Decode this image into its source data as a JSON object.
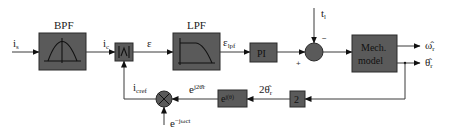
{
  "diagram": {
    "type": "block-diagram",
    "colors": {
      "block_fill": "#5a5a5a",
      "wire": "#3a3a3a",
      "background": "#ffffff"
    },
    "blocks": {
      "bpf": {
        "title": "BPF",
        "icon": "bandpass-curve-icon"
      },
      "abs": {
        "label": "|∧|",
        "icon": "absolute-value-icon"
      },
      "lpf": {
        "title": "LPF",
        "icon": "lowpass-curve-icon"
      },
      "pi": {
        "label": "PI"
      },
      "mech": {
        "line1": "Mech.",
        "line2": "model"
      },
      "exp": {
        "base": "e",
        "exponent": "j(θ)"
      },
      "gain": {
        "label": "2"
      }
    },
    "signals": {
      "input": {
        "main": "i",
        "sub": "s"
      },
      "ic": {
        "main": "i",
        "sub": "c"
      },
      "eps": {
        "main": "ε"
      },
      "eps_lpf": {
        "main": "ε",
        "sub": "lpf"
      },
      "tl": {
        "main": "t",
        "sub": "l"
      },
      "omega": {
        "main": "ω̂",
        "sub": "r"
      },
      "theta": {
        "main": "θ̂",
        "sub": "r"
      },
      "two_theta": {
        "main": "2θ̂",
        "sub": "r"
      },
      "exp_two_theta": {
        "main": "e",
        "sup": "j2θ̂r"
      },
      "icref": {
        "main": "i",
        "sub": "cref"
      },
      "carrier": {
        "main": "e",
        "sup": "−jωct"
      }
    },
    "summing_junction": {
      "plus": "+",
      "minus": "−"
    }
  }
}
